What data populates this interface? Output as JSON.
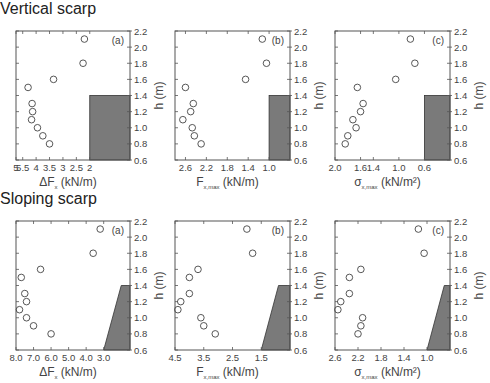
{
  "sections": {
    "vertical": "Vertical scarp",
    "sloping": "Sloping scarp"
  },
  "colors": {
    "scarp_fill": "#7a7a7a",
    "axis": "#555555",
    "marker": "#444444"
  },
  "chart_data": [
    {
      "type": "scatter",
      "section": "Vertical scarp",
      "panel_label": "(a)",
      "xlabel_main": "ΔF",
      "xlabel_sub": "x",
      "xlabel_unit": " (kN/m)",
      "ylabel": "h (m)",
      "xlim": [
        5.0,
        1.0
      ],
      "ylim": [
        0.6,
        2.2
      ],
      "xticks": [
        5,
        5.5,
        4,
        3.5,
        3,
        2.5,
        2
      ],
      "xtick_labels": [
        "5",
        "5.5",
        "4",
        "3.5",
        "3",
        "2.5",
        "2"
      ],
      "xtick_positions": [
        5.75,
        5.5,
        5.0,
        4.5,
        4.0,
        3.5,
        3.0
      ],
      "xlim_plot": [
        5.75,
        1.5
      ],
      "yticks": [
        0.6,
        0.8,
        1.0,
        1.2,
        1.4,
        1.6,
        1.8,
        2.0,
        2.2
      ],
      "points": [
        {
          "x": 3.2,
          "y": 2.1
        },
        {
          "x": 3.25,
          "y": 1.8
        },
        {
          "x": 4.35,
          "y": 1.6
        },
        {
          "x": 5.3,
          "y": 1.5
        },
        {
          "x": 5.15,
          "y": 1.3
        },
        {
          "x": 5.13,
          "y": 1.2
        },
        {
          "x": 5.17,
          "y": 1.1
        },
        {
          "x": 4.95,
          "y": 1.0
        },
        {
          "x": 4.75,
          "y": 0.9
        },
        {
          "x": 4.5,
          "y": 0.8
        }
      ],
      "scarp": {
        "shape": "vertical",
        "x_start": 3.0,
        "top": 1.4
      }
    },
    {
      "type": "scatter",
      "section": "Vertical scarp",
      "panel_label": "(b)",
      "xlabel_main": "F",
      "xlabel_sub": "x,max",
      "xlabel_unit": " (kN/m)",
      "ylabel": "h (m)",
      "xtick_labels": [
        "2.6",
        "2.2",
        "1.8",
        "1.4",
        "1.0"
      ],
      "xtick_positions": [
        2.6,
        2.2,
        1.8,
        1.4,
        1.0
      ],
      "xlim_plot": [
        2.8,
        0.6
      ],
      "yticks": [
        0.6,
        0.8,
        1.0,
        1.2,
        1.4,
        1.6,
        1.8,
        2.0,
        2.2
      ],
      "points": [
        {
          "x": 1.13,
          "y": 2.1
        },
        {
          "x": 1.05,
          "y": 1.8
        },
        {
          "x": 1.45,
          "y": 1.6
        },
        {
          "x": 2.6,
          "y": 1.5
        },
        {
          "x": 2.45,
          "y": 1.3
        },
        {
          "x": 2.5,
          "y": 1.2
        },
        {
          "x": 2.65,
          "y": 1.1
        },
        {
          "x": 2.47,
          "y": 1.0
        },
        {
          "x": 2.43,
          "y": 0.9
        },
        {
          "x": 2.3,
          "y": 0.8
        }
      ],
      "scarp": {
        "shape": "vertical",
        "x_start": 1.0,
        "top": 1.4
      }
    },
    {
      "type": "scatter",
      "section": "Vertical scarp",
      "panel_label": "(c)",
      "xlabel_main": "σ",
      "xlabel_sub": "x,max",
      "xlabel_unit": " (kN/m²)",
      "ylabel": "h (m)",
      "xtick_labels": [
        "2.0",
        "1.6",
        "1.4",
        "1.0",
        "0.6"
      ],
      "xtick_positions": [
        2.0,
        1.6,
        1.4,
        1.0,
        0.6
      ],
      "xlim_plot": [
        2.0,
        0.2
      ],
      "yticks": [
        0.6,
        0.8,
        1.0,
        1.2,
        1.4,
        1.6,
        1.8,
        2.0,
        2.2
      ],
      "points": [
        {
          "x": 0.82,
          "y": 2.1
        },
        {
          "x": 0.75,
          "y": 1.8
        },
        {
          "x": 1.05,
          "y": 1.6
        },
        {
          "x": 1.65,
          "y": 1.5
        },
        {
          "x": 1.56,
          "y": 1.3
        },
        {
          "x": 1.6,
          "y": 1.2
        },
        {
          "x": 1.72,
          "y": 1.1
        },
        {
          "x": 1.67,
          "y": 1.0
        },
        {
          "x": 1.8,
          "y": 0.9
        },
        {
          "x": 1.84,
          "y": 0.8
        }
      ],
      "scarp": {
        "shape": "vertical",
        "x_start": 0.6,
        "top": 1.4
      }
    },
    {
      "type": "scatter",
      "section": "Sloping scarp",
      "panel_label": "(a)",
      "xlabel_main": "ΔF",
      "xlabel_sub": "x",
      "xlabel_unit": " (kN/m)",
      "ylabel": "h (m)",
      "xtick_labels": [
        "8.0",
        "7.0",
        "6.0",
        "5.0",
        "4.0",
        "3.0"
      ],
      "xtick_positions": [
        8.0,
        7.0,
        6.0,
        5.0,
        4.0,
        3.0
      ],
      "xlim_plot": [
        8.0,
        1.5
      ],
      "yticks": [
        0.6,
        0.8,
        1.0,
        1.2,
        1.4,
        1.6,
        1.8,
        2.0,
        2.2
      ],
      "points": [
        {
          "x": 3.2,
          "y": 2.1
        },
        {
          "x": 3.6,
          "y": 1.8
        },
        {
          "x": 6.6,
          "y": 1.6
        },
        {
          "x": 7.7,
          "y": 1.5
        },
        {
          "x": 7.5,
          "y": 1.3
        },
        {
          "x": 7.4,
          "y": 1.2
        },
        {
          "x": 7.8,
          "y": 1.1
        },
        {
          "x": 7.4,
          "y": 1.0
        },
        {
          "x": 7.0,
          "y": 0.9
        },
        {
          "x": 6.0,
          "y": 0.8
        }
      ],
      "scarp": {
        "shape": "sloping",
        "x_start": 3.0,
        "x_top": 2.0,
        "top": 1.4
      }
    },
    {
      "type": "scatter",
      "section": "Sloping scarp",
      "panel_label": "(b)",
      "xlabel_main": "F",
      "xlabel_sub": "x,max",
      "xlabel_unit": " (kN/m)",
      "ylabel": "h (m)",
      "xtick_labels": [
        "4.5",
        "3.5",
        "2.5",
        "1.5"
      ],
      "xtick_positions": [
        4.5,
        3.5,
        2.5,
        1.5
      ],
      "xlim_plot": [
        4.5,
        0.5
      ],
      "yticks": [
        0.6,
        0.8,
        1.0,
        1.2,
        1.4,
        1.6,
        1.8,
        2.0,
        2.2
      ],
      "points": [
        {
          "x": 2.0,
          "y": 2.1
        },
        {
          "x": 1.8,
          "y": 1.8
        },
        {
          "x": 3.7,
          "y": 1.6
        },
        {
          "x": 4.0,
          "y": 1.5
        },
        {
          "x": 4.0,
          "y": 1.3
        },
        {
          "x": 4.3,
          "y": 1.2
        },
        {
          "x": 4.4,
          "y": 1.1
        },
        {
          "x": 3.6,
          "y": 1.0
        },
        {
          "x": 3.5,
          "y": 0.9
        },
        {
          "x": 3.1,
          "y": 0.8
        }
      ],
      "scarp": {
        "shape": "sloping",
        "x_start": 1.5,
        "x_top": 0.9,
        "top": 1.4
      }
    },
    {
      "type": "scatter",
      "section": "Sloping scarp",
      "panel_label": "(c)",
      "xlabel_main": "σ",
      "xlabel_sub": "x,max",
      "xlabel_unit": " (kN/m²)",
      "ylabel": "h (m)",
      "xtick_labels": [
        "2.6",
        "2.2",
        "1.8",
        "1.4",
        "1.0"
      ],
      "xtick_positions": [
        2.6,
        2.2,
        1.8,
        1.4,
        1.0
      ],
      "xlim_plot": [
        2.6,
        0.6
      ],
      "yticks": [
        0.6,
        0.8,
        1.0,
        1.2,
        1.4,
        1.6,
        1.8,
        2.0,
        2.2
      ],
      "points": [
        {
          "x": 1.15,
          "y": 2.1
        },
        {
          "x": 1.05,
          "y": 1.8
        },
        {
          "x": 2.15,
          "y": 1.6
        },
        {
          "x": 2.35,
          "y": 1.5
        },
        {
          "x": 2.35,
          "y": 1.3
        },
        {
          "x": 2.5,
          "y": 1.2
        },
        {
          "x": 2.55,
          "y": 1.1
        },
        {
          "x": 2.12,
          "y": 1.0
        },
        {
          "x": 2.15,
          "y": 0.9
        },
        {
          "x": 2.2,
          "y": 0.8
        }
      ],
      "scarp": {
        "shape": "sloping",
        "x_start": 1.0,
        "x_top": 0.7,
        "top": 1.4
      }
    }
  ]
}
